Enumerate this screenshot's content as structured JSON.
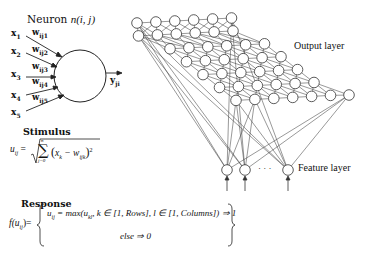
{
  "neuron": {
    "title": "Neuron",
    "title_var": "n(i, j)",
    "inputs": [
      {
        "x": "x",
        "x_sub": "1",
        "w": "w",
        "w_sub": "ij1"
      },
      {
        "x": "x",
        "x_sub": "2",
        "w": "w",
        "w_sub": "ij2"
      },
      {
        "x": "x",
        "x_sub": "3",
        "w": "w",
        "w_sub": "ij3"
      },
      {
        "x": "x",
        "x_sub": "4",
        "w": "w",
        "w_sub": "ij4"
      },
      {
        "x": "x",
        "x_sub": "5",
        "w": "w",
        "w_sub": "ij5"
      }
    ],
    "output": "y",
    "output_sub": "ji"
  },
  "stimulus": {
    "heading": "Stimulus",
    "lhs": "u",
    "lhs_sub": "ij",
    "sum_top": "n",
    "sum_bottom": "j=0",
    "body": "(x",
    "body_sub": "k",
    "minus": " − w",
    "minus_sub": "ijk",
    "close": ")",
    "power": "2"
  },
  "response": {
    "heading": "Response",
    "lhs": "f(u",
    "lhs_sub": "ij",
    "lhs_close": ")=",
    "case1": "u",
    "case1_sub": "ij",
    "case1_rest": " = max(u",
    "case1_sub2": "kl",
    "case1_rest2": ", k ∈ [1, Rows], l ∈ [1, Columns]) ⇒ 1",
    "case2": "else ⇒ 0"
  },
  "network": {
    "output_layer_label": "Output layer",
    "feature_layer_label": "Feature layer",
    "ellipsis": "· · ·",
    "grid_columns": 6,
    "grid_rows": 7
  },
  "colors": {
    "line": "#333333",
    "node_fill": "#ffffff",
    "text": "#111111"
  }
}
